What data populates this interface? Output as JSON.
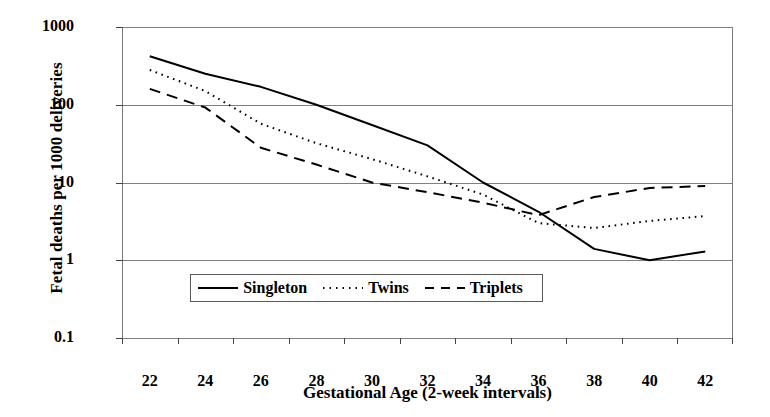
{
  "chart_data": {
    "type": "line",
    "title": "",
    "xlabel": "Gestational Age (2-week intervals)",
    "ylabel": "Fetal deaths per 1000 deliveries",
    "x": [
      22,
      24,
      26,
      28,
      30,
      32,
      34,
      36,
      38,
      40,
      42
    ],
    "categories": [
      "22",
      "24",
      "26",
      "28",
      "30",
      "32",
      "34",
      "36",
      "38",
      "40",
      "42"
    ],
    "yscale": "log",
    "ylim": [
      0.1,
      1000
    ],
    "yticks": [
      1000,
      100,
      10,
      1,
      0.1
    ],
    "ytick_labels": [
      "1000",
      "100",
      "10",
      "1",
      "0.1"
    ],
    "grid": "horizontal",
    "legend_position": "bottom-center",
    "series": [
      {
        "name": "Singleton",
        "style": "solid",
        "color": "#000000",
        "values": [
          420,
          250,
          170,
          100,
          55,
          30,
          10,
          4.2,
          1.4,
          1.0,
          1.3
        ]
      },
      {
        "name": "Twins",
        "style": "dotted",
        "color": "#000000",
        "values": [
          280,
          150,
          57,
          32,
          20,
          12,
          7,
          3.0,
          2.6,
          3.2,
          3.7
        ]
      },
      {
        "name": "Triplets",
        "style": "dashed",
        "color": "#000000",
        "values": [
          160,
          92,
          28,
          17,
          10,
          7.5,
          5.5,
          3.8,
          6.5,
          8.5,
          9.0
        ]
      }
    ]
  },
  "legend": {
    "items": [
      {
        "label": "Singleton",
        "style": "solid"
      },
      {
        "label": "Twins",
        "style": "dotted"
      },
      {
        "label": "Triplets",
        "style": "dashed"
      }
    ]
  }
}
